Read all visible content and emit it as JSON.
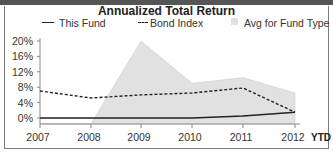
{
  "chart_data": {
    "type": "line",
    "title": "Annualized Total Return",
    "xlabel": "",
    "ylabel": "",
    "categories": [
      "2007",
      "2008",
      "2009",
      "2010",
      "2011",
      "2012"
    ],
    "x_suffix_label": "YTD",
    "yticks": [
      "0%",
      "4%",
      "8%",
      "12%",
      "16%",
      "20%"
    ],
    "ylim": [
      -2,
      21
    ],
    "grid": false,
    "legend_position": "top",
    "series": [
      {
        "name": "This Fund",
        "style": "solid-line",
        "values": [
          0,
          0,
          0,
          0,
          0.5,
          1.5
        ]
      },
      {
        "name": "Bond Index",
        "style": "dashed-line",
        "values": [
          7,
          5.2,
          6,
          6.5,
          7.8,
          1.5
        ]
      },
      {
        "name": "Avg for Fund Type",
        "style": "area",
        "values": [
          -1.5,
          -1.5,
          20,
          9,
          10.5,
          6.5
        ]
      }
    ],
    "colors": {
      "line": "#222222",
      "area": "#e1e1e1",
      "axis": "#888888"
    }
  },
  "legend": {
    "this_fund": "This Fund",
    "bond_index": "Bond Index",
    "avg_fund_type": "Avg for Fund Type"
  }
}
